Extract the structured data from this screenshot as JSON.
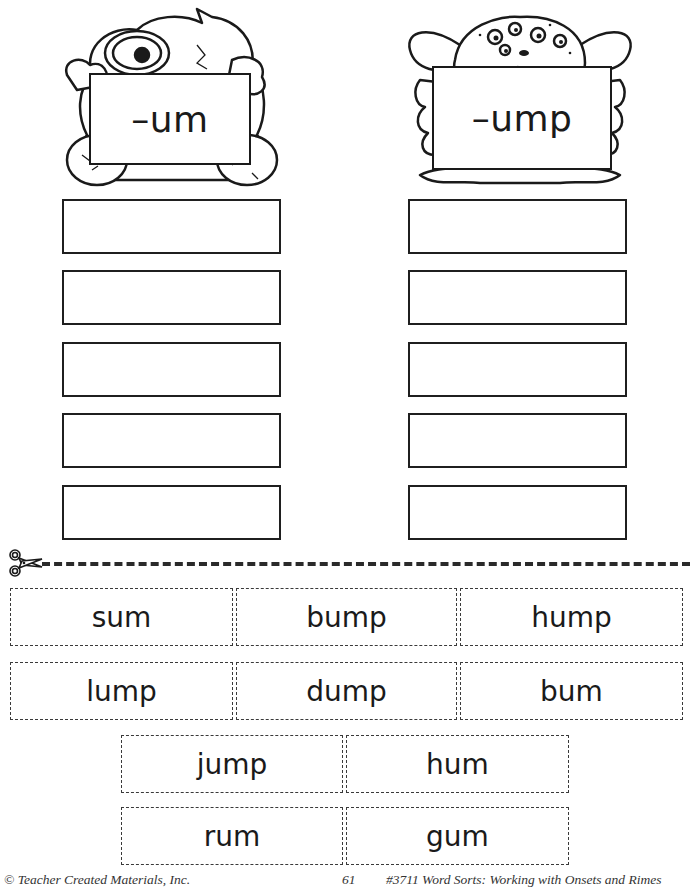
{
  "header": {
    "left_sign": {
      "label": "–um",
      "icon": "furry-one-eyed-monster-icon"
    },
    "right_sign": {
      "label": "–ump",
      "icon": "many-eyed-goblin-monster-icon"
    }
  },
  "sort_columns": [
    {
      "rime": "–um",
      "answer_boxes": 5
    },
    {
      "rime": "–ump",
      "answer_boxes": 5
    }
  ],
  "cut_line": {
    "icon": "scissors-icon"
  },
  "word_cards": {
    "row1": [
      "sum",
      "bump",
      "hump"
    ],
    "row2": [
      "lump",
      "dump",
      "bum"
    ],
    "row3": [
      "jump",
      "hum"
    ],
    "row4": [
      "rum",
      "gum"
    ]
  },
  "footer": {
    "copyright": "© Teacher Created Materials, Inc.",
    "page_number": "61",
    "book_title": "#3711 Word Sorts:  Working with Onsets and Rimes"
  }
}
